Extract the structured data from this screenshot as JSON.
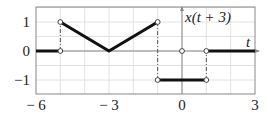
{
  "chart_data": {
    "type": "line",
    "title": "",
    "curve_label": "x(t + 3)",
    "xlabel": "t",
    "ylabel": "",
    "xlim": [
      -6,
      3
    ],
    "ylim": [
      -1.5,
      1.5
    ],
    "x_ticks": [
      -6,
      -3,
      0,
      3
    ],
    "x_tick_labels": [
      "− 6",
      "− 3",
      "0",
      "3"
    ],
    "y_ticks": [
      1,
      0,
      -1
    ],
    "y_tick_labels": [
      "1",
      "0",
      "−1"
    ],
    "grid": true,
    "segments": [
      {
        "points": [
          [
            -6,
            0
          ],
          [
            -5,
            0
          ]
        ]
      },
      {
        "points": [
          [
            -5,
            1
          ],
          [
            -3,
            0
          ],
          [
            -1,
            1
          ]
        ]
      },
      {
        "points": [
          [
            -1,
            -1
          ],
          [
            1,
            -1
          ]
        ]
      },
      {
        "points": [
          [
            1,
            0
          ],
          [
            3,
            0
          ]
        ]
      }
    ],
    "dashdot_verticals": [
      {
        "t": -5,
        "from": 0,
        "to": 1
      },
      {
        "t": -1,
        "from": 1,
        "to": -1
      },
      {
        "t": 1,
        "from": -1,
        "to": 0
      }
    ],
    "open_circles": [
      [
        -5,
        0
      ],
      [
        -5,
        1
      ],
      [
        -1,
        1
      ],
      [
        -1,
        -1
      ],
      [
        0,
        0
      ],
      [
        1,
        -1
      ],
      [
        1,
        0
      ]
    ]
  }
}
